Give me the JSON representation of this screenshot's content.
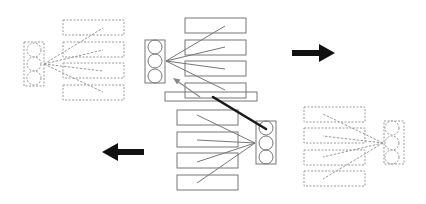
{
  "diagram": {
    "colors": {
      "solid_stroke": "#777777",
      "dashed_stroke": "#9a9a9a",
      "thick_line": "#1a1a1a",
      "arrow_fill": "#111111",
      "small_arrow": "#888888",
      "background": "#ffffff"
    },
    "groups": [
      {
        "id": "top-left-ghost",
        "style": "dashed",
        "circle_box": {
          "x": 24,
          "y": 42,
          "w": 20,
          "h": 44
        },
        "circles": [
          {
            "cx": 34,
            "cy": 50
          },
          {
            "cx": 34,
            "cy": 64
          },
          {
            "cx": 34,
            "cy": 78
          }
        ],
        "radius": 7,
        "hub": {
          "x": 44,
          "y": 64
        },
        "rects": [
          {
            "x": 63,
            "y": 20,
            "w": 61,
            "h": 15
          },
          {
            "x": 63,
            "y": 42,
            "w": 61,
            "h": 15
          },
          {
            "x": 63,
            "y": 63,
            "w": 61,
            "h": 15
          },
          {
            "x": 63,
            "y": 85,
            "w": 61,
            "h": 15
          }
        ],
        "line_ends": [
          {
            "x": 103,
            "y": 28
          },
          {
            "x": 103,
            "y": 50
          },
          {
            "x": 103,
            "y": 71
          },
          {
            "x": 103,
            "y": 92
          }
        ]
      },
      {
        "id": "top-center",
        "style": "solid",
        "circle_box": {
          "x": 145,
          "y": 40,
          "w": 20,
          "h": 43
        },
        "circles": [
          {
            "cx": 155,
            "cy": 47
          },
          {
            "cx": 155,
            "cy": 61
          },
          {
            "cx": 155,
            "cy": 76
          }
        ],
        "radius": 7,
        "hub": {
          "x": 166,
          "y": 61
        },
        "rects": [
          {
            "x": 185,
            "y": 18,
            "w": 61,
            "h": 15
          },
          {
            "x": 185,
            "y": 40,
            "w": 61,
            "h": 15
          },
          {
            "x": 185,
            "y": 61,
            "w": 61,
            "h": 15
          },
          {
            "x": 185,
            "y": 83,
            "w": 61,
            "h": 15
          }
        ],
        "line_ends": [
          {
            "x": 225,
            "y": 26
          },
          {
            "x": 225,
            "y": 47
          },
          {
            "x": 225,
            "y": 69
          },
          {
            "x": 225,
            "y": 90
          }
        ]
      },
      {
        "id": "bottom-center",
        "style": "solid",
        "circle_box": {
          "x": 256,
          "y": 121,
          "w": 20,
          "h": 43
        },
        "circles": [
          {
            "cx": 266,
            "cy": 128
          },
          {
            "cx": 266,
            "cy": 143
          },
          {
            "cx": 266,
            "cy": 157
          }
        ],
        "radius": 7,
        "hub": {
          "x": 255,
          "y": 143
        },
        "rects": [
          {
            "x": 177,
            "y": 110,
            "w": 61,
            "h": 15
          },
          {
            "x": 177,
            "y": 132,
            "w": 61,
            "h": 15
          },
          {
            "x": 177,
            "y": 153,
            "w": 61,
            "h": 15
          },
          {
            "x": 177,
            "y": 175,
            "w": 61,
            "h": 15
          }
        ],
        "line_ends": [
          {
            "x": 197,
            "y": 115
          },
          {
            "x": 197,
            "y": 140
          },
          {
            "x": 197,
            "y": 162
          },
          {
            "x": 197,
            "y": 183
          }
        ],
        "extra_rect": {
          "x": 165,
          "y": 92,
          "w": 92,
          "h": 9
        }
      },
      {
        "id": "bottom-right-ghost",
        "style": "dashed",
        "circle_box": {
          "x": 384,
          "y": 121,
          "w": 20,
          "h": 43
        },
        "circles": [
          {
            "cx": 392,
            "cy": 128
          },
          {
            "cx": 392,
            "cy": 143
          },
          {
            "cx": 392,
            "cy": 157
          }
        ],
        "radius": 7,
        "hub": {
          "x": 383,
          "y": 143
        },
        "rects": [
          {
            "x": 304,
            "y": 107,
            "w": 61,
            "h": 15
          },
          {
            "x": 304,
            "y": 128,
            "w": 61,
            "h": 15
          },
          {
            "x": 304,
            "y": 150,
            "w": 61,
            "h": 15
          },
          {
            "x": 304,
            "y": 171,
            "w": 61,
            "h": 15
          }
        ],
        "line_ends": [
          {
            "x": 323,
            "y": 114
          },
          {
            "x": 323,
            "y": 136
          },
          {
            "x": 323,
            "y": 157
          },
          {
            "x": 323,
            "y": 179
          }
        ]
      }
    ],
    "connector_line": {
      "x1": 213,
      "y1": 97,
      "x2": 266,
      "y2": 129
    },
    "small_arrow": {
      "x1": 200,
      "y1": 97,
      "x2": 173,
      "y2": 78
    },
    "big_arrows": [
      {
        "id": "arrow-right",
        "direction": "right",
        "x1": 292,
        "x2": 335,
        "y": 53
      },
      {
        "id": "arrow-left",
        "direction": "left",
        "x1": 144,
        "x2": 102,
        "y": 152
      }
    ]
  }
}
